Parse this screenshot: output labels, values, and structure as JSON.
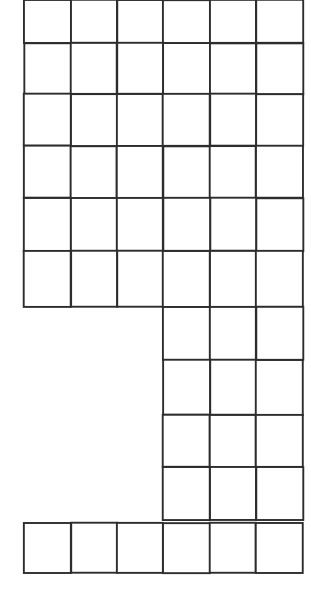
{
  "figure": {
    "kind": "grid-diagram",
    "background_color": "#ffffff",
    "line_color": "#1c1c1c",
    "line_width_px": 1.9,
    "canvas": {
      "width": 311,
      "height": 609
    },
    "text_labels": []
  },
  "grid": {
    "columns": 6,
    "column_edges_px": [
      24,
      71,
      117,
      163,
      210,
      256,
      303
    ],
    "cell_width_px": 46.5,
    "row_edges_px": [
      0,
      43,
      94,
      146,
      198,
      251,
      307,
      360,
      415,
      467,
      520,
      523,
      573
    ],
    "cell_height_px": 51,
    "top_row_clipped": true
  },
  "blocks": [
    {
      "name": "top-block",
      "description": "Full-width block of 6 columns; topmost row is clipped by the image edge",
      "col_start": 0,
      "col_end": 6,
      "row_tops_px": [
        0,
        43,
        94,
        146,
        198,
        251
      ],
      "row_bottoms_px": [
        43,
        94,
        146,
        198,
        251,
        307
      ],
      "rows": 6,
      "cells": 36
    },
    {
      "name": "right-column-block",
      "description": "Right-hand block of 3 columns descending below the top block",
      "col_start": 3,
      "col_end": 6,
      "row_tops_px": [
        307,
        360,
        415,
        467
      ],
      "row_bottoms_px": [
        360,
        415,
        467,
        520
      ],
      "rows": 4,
      "cells": 12
    },
    {
      "name": "bottom-row-block",
      "description": "Full-width single row of 6 squares at the bottom",
      "col_start": 0,
      "col_end": 6,
      "row_tops_px": [
        523
      ],
      "row_bottoms_px": [
        573
      ],
      "rows": 1,
      "cells": 6
    }
  ],
  "empty_region": {
    "name": "left-gap",
    "description": "Blank white area with no squares, left of the right-column block",
    "col_start": 0,
    "col_end": 3,
    "top_px": 307,
    "bottom_px": 523
  },
  "totals": {
    "total_cells": 54,
    "total_columns": 6,
    "total_row_bands": 11
  }
}
